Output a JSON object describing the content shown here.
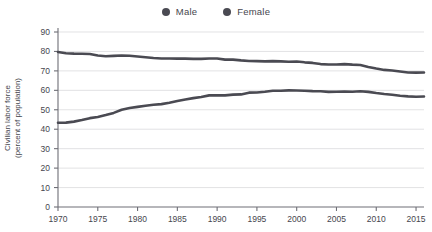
{
  "legend": {
    "position": "top-center",
    "items": [
      {
        "label": "Male",
        "color": "#4a4a52",
        "marker": "circle-marker"
      },
      {
        "label": "Female",
        "color": "#4a4a52",
        "marker": "circle-marker"
      }
    ]
  },
  "axis": {
    "ylabel_line1": "Civilian labor force",
    "ylabel_line2": "(percent of population)"
  },
  "chart_data": {
    "type": "line",
    "title": "",
    "subtitle": "",
    "xlabel": "",
    "ylabel": "Civilian labor force (percent of population)",
    "grid": "horizontal",
    "legend_position": "top-center",
    "xlim": [
      1970,
      2016
    ],
    "ylim": [
      0,
      90
    ],
    "yticks": [
      0,
      10,
      20,
      30,
      40,
      50,
      60,
      70,
      80,
      90
    ],
    "ytick_labels": [
      "0",
      "10",
      "20",
      "30",
      "40",
      "50",
      "60",
      "70",
      "80",
      "90"
    ],
    "xticks": [
      1970,
      1975,
      1980,
      1985,
      1990,
      1995,
      2000,
      2005,
      2010,
      2015
    ],
    "xtick_labels": [
      "1970",
      "1975",
      "1980",
      "1985",
      "1990",
      "1995",
      "2000",
      "2005",
      "2010",
      "2015"
    ],
    "x": [
      1970,
      1971,
      1972,
      1973,
      1974,
      1975,
      1976,
      1977,
      1978,
      1979,
      1980,
      1981,
      1982,
      1983,
      1984,
      1985,
      1986,
      1987,
      1988,
      1989,
      1990,
      1991,
      1992,
      1993,
      1994,
      1995,
      1996,
      1997,
      1998,
      1999,
      2000,
      2001,
      2002,
      2003,
      2004,
      2005,
      2006,
      2007,
      2008,
      2009,
      2010,
      2011,
      2012,
      2013,
      2014,
      2015,
      2016
    ],
    "series": [
      {
        "name": "Male",
        "color": "#4a4a52",
        "values": [
          79.7,
          79.1,
          78.9,
          78.8,
          78.7,
          77.9,
          77.5,
          77.7,
          77.9,
          77.8,
          77.4,
          77.0,
          76.6,
          76.4,
          76.4,
          76.3,
          76.3,
          76.2,
          76.2,
          76.4,
          76.4,
          75.8,
          75.8,
          75.4,
          75.1,
          75.0,
          74.9,
          75.0,
          74.9,
          74.7,
          74.8,
          74.4,
          74.1,
          73.5,
          73.3,
          73.3,
          73.5,
          73.2,
          73.0,
          72.0,
          71.2,
          70.5,
          70.2,
          69.7,
          69.2,
          69.1,
          69.2
        ]
      },
      {
        "name": "Female",
        "color": "#4a4a52",
        "values": [
          43.3,
          43.4,
          43.9,
          44.7,
          45.7,
          46.3,
          47.3,
          48.4,
          50.0,
          50.9,
          51.5,
          52.1,
          52.6,
          52.9,
          53.6,
          54.5,
          55.3,
          56.0,
          56.6,
          57.4,
          57.5,
          57.4,
          57.8,
          57.9,
          58.8,
          58.9,
          59.3,
          59.8,
          59.8,
          60.0,
          59.9,
          59.8,
          59.6,
          59.5,
          59.2,
          59.3,
          59.4,
          59.3,
          59.5,
          59.2,
          58.6,
          58.1,
          57.7,
          57.2,
          56.9,
          56.7,
          56.8
        ]
      }
    ]
  }
}
